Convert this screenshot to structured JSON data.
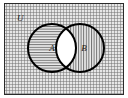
{
  "figure": {
    "name": "venn-diagram-two-sets",
    "universe": {
      "label": "U",
      "shading": "cross-hatch-grid",
      "border_color": "#000000",
      "fill_color": "#d8d8d8"
    },
    "sets": [
      {
        "id": "A",
        "label": "A",
        "shading": "horizontal-lines",
        "fill_color": "#dcdcdc",
        "stroke_color": "#000000",
        "center_x": 52,
        "center_y": 48,
        "radius": 24
      },
      {
        "id": "B",
        "label": "B",
        "shading": "vertical-lines",
        "fill_color": "#dcdcdc",
        "stroke_color": "#000000",
        "center_x": 80,
        "center_y": 48,
        "radius": 24
      }
    ],
    "intersection": {
      "shading": "none",
      "fill_color": "#ffffff"
    },
    "colors": {
      "ink": "#000000",
      "paper": "#ffffff",
      "hatch": "#6e6e6e"
    }
  }
}
